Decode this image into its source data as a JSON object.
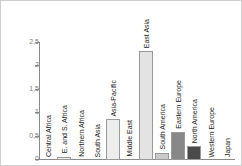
{
  "chart_data": {
    "type": "bar",
    "title": "",
    "subtitle": "",
    "xlabel": "",
    "ylabel": "",
    "ylim": [
      0,
      2.5
    ],
    "grid": false,
    "legend": "none",
    "decimal_separator": ",",
    "y_ticks": [
      "0",
      "0,5",
      "1",
      "1,5",
      "2",
      "2,5"
    ],
    "y_tick_values": [
      0,
      0.5,
      1,
      1.5,
      2,
      2.5
    ],
    "categories": [
      "Central Africa",
      "E. and S. Africa",
      "Northern Africa",
      "South Asia",
      "Asia-Pacific",
      "Middle East",
      "East Asia",
      "South America",
      "Eastern Europe",
      "North America",
      "Western Europe",
      "Japan"
    ],
    "values": [
      0,
      0.07,
      0,
      0,
      0.87,
      0,
      2.33,
      0.15,
      0.6,
      0.29,
      0,
      0
    ],
    "bar_colors": [
      "#ededed",
      "#ededed",
      "#ededed",
      "#ededed",
      "#ededed",
      "#ededed",
      "#e3e3e3",
      "#c9c9c9",
      "#888888",
      "#4a4a4a",
      "#ededed",
      "#ededed"
    ],
    "axis_color": "#8a8a8a",
    "tick_text_color": "#7d7d7d",
    "label_text_color": "#1c1c1c",
    "background_color": "#ffffff",
    "frame_color": "#cfcfcf"
  }
}
